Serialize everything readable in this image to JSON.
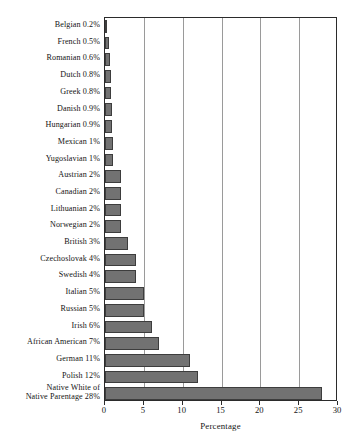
{
  "chart_data": {
    "type": "bar",
    "orientation": "horizontal",
    "title": "",
    "xlabel": "Percentage",
    "ylabel": "",
    "xlim": [
      0,
      30
    ],
    "xticks": [
      0,
      5,
      10,
      15,
      20,
      25,
      30
    ],
    "xtick_labels": [
      "0",
      "5",
      "10",
      "15",
      "20",
      "25",
      "30"
    ],
    "grid": "vertical",
    "legend": "none",
    "bar_color": "#727272",
    "bar_edge_color": "#3d3d3d",
    "categories": [
      "Belgian",
      "French",
      "Romanian",
      "Dutch",
      "Greek",
      "Danish",
      "Hungarian",
      "Mexican",
      "Yugoslavian",
      "Austrian",
      "Canadian",
      "Lithuanian",
      "Norwegian",
      "British",
      "Czechoslovak",
      "Swedish",
      "Italian",
      "Russian",
      "Irish",
      "African American",
      "German",
      "Polish",
      "Native White of Native Parentage"
    ],
    "values": [
      0.2,
      0.5,
      0.6,
      0.8,
      0.8,
      0.9,
      0.9,
      1,
      1,
      2,
      2,
      2,
      2,
      3,
      4,
      4,
      5,
      5,
      6,
      7,
      11,
      12,
      28
    ],
    "tick_labels": [
      "Belgian 0.2%",
      "French 0.5%",
      "Romanian 0.6%",
      "Dutch 0.8%",
      "Greek 0.8%",
      "Danish 0.9%",
      "Hungarian 0.9%",
      "Mexican 1%",
      "Yugoslavian 1%",
      "Austrian 2%",
      "Canadian 2%",
      "Lithuanian 2%",
      "Norwegian 2%",
      "British 3%",
      "Czechoslovak 4%",
      "Swedish 4%",
      "Italian 5%",
      "Russian 5%",
      "Irish 6%",
      "African American 7%",
      "German 11%",
      "Polish 12%",
      "Native White of\nNative Parentage 28%"
    ]
  }
}
